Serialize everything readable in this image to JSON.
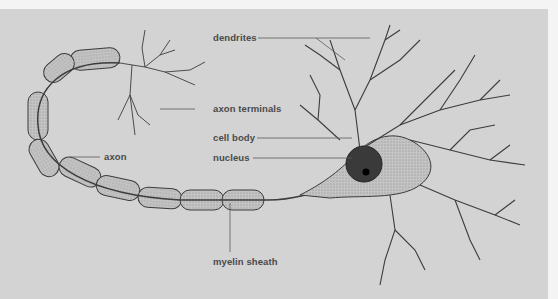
{
  "diagram": {
    "background_color": "#d3d3d3",
    "line_color": "#3c3c3c",
    "label_color": "#4a4a4a",
    "labels": {
      "dendrites": "dendrites",
      "axon_terminals": "axon terminals",
      "cell_body": "cell body",
      "nucleus": "nucleus",
      "axon": "axon",
      "myelin_sheath": "myelin sheath"
    }
  }
}
